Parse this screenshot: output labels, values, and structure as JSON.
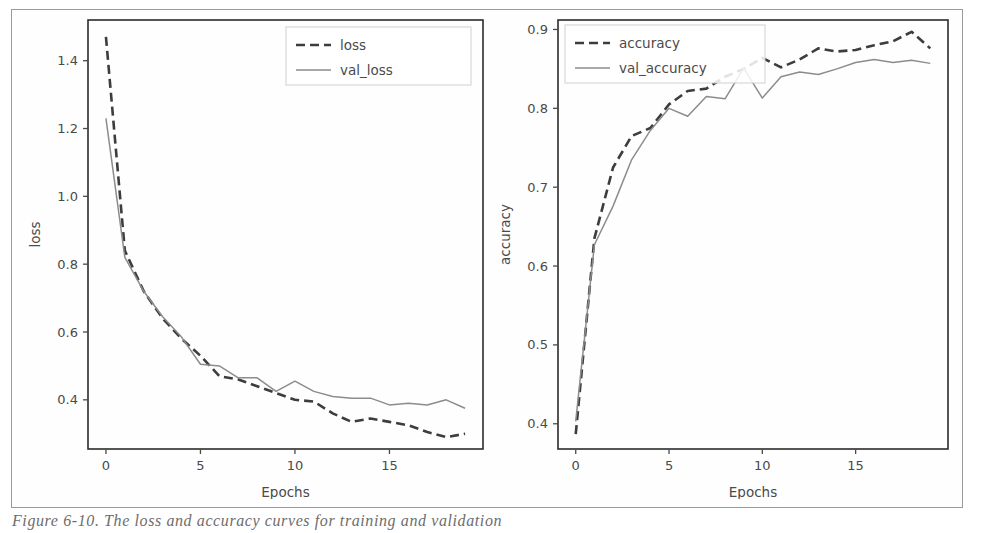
{
  "figure": {
    "caption": "Figure 6-10. The loss and accuracy curves for training and validation",
    "background_color": "#ffffff",
    "frame_color": "#9a9a9a"
  },
  "style": {
    "train_color": "#3d3d3d",
    "val_color": "#8c8c8c",
    "axis_color": "#4a4a4a",
    "spine_color": "#2b2b2b"
  },
  "panels": [
    {
      "name": "loss-panel",
      "xlabel": "Epochs",
      "ylabel": "loss",
      "xticks": [
        "0",
        "5",
        "10",
        "15"
      ],
      "yticks": [
        "0.4",
        "0.6",
        "0.8",
        "1.0",
        "1.2",
        "1.4"
      ],
      "legend": [
        {
          "label": "loss",
          "style": "dashed"
        },
        {
          "label": "val_loss",
          "style": "solid"
        }
      ]
    },
    {
      "name": "accuracy-panel",
      "xlabel": "Epochs",
      "ylabel": "accuracy",
      "xticks": [
        "0",
        "5",
        "10",
        "15"
      ],
      "yticks": [
        "0.4",
        "0.5",
        "0.6",
        "0.7",
        "0.8",
        "0.9"
      ],
      "legend": [
        {
          "label": "accuracy",
          "style": "dashed"
        },
        {
          "label": "val_accuracy",
          "style": "solid"
        }
      ]
    }
  ],
  "chart_data": [
    {
      "type": "line",
      "title": "",
      "xlabel": "Epochs",
      "ylabel": "loss",
      "xlim": [
        -0.95,
        19.95
      ],
      "ylim": [
        0.255,
        1.52
      ],
      "xticks": [
        0,
        5,
        10,
        15
      ],
      "yticks": [
        0.4,
        0.6,
        0.8,
        1.0,
        1.2,
        1.4
      ],
      "grid": false,
      "legend_position": "upper right",
      "x": [
        0,
        1,
        2,
        3,
        4,
        5,
        6,
        7,
        8,
        9,
        10,
        11,
        12,
        13,
        14,
        15,
        16,
        17,
        18,
        19
      ],
      "series": [
        {
          "name": "loss",
          "style": "dashed",
          "color": "#3d3d3d",
          "values": [
            1.47,
            0.84,
            0.72,
            0.64,
            0.58,
            0.53,
            0.47,
            0.46,
            0.44,
            0.42,
            0.4,
            0.395,
            0.36,
            0.335,
            0.345,
            0.335,
            0.325,
            0.305,
            0.29,
            0.3
          ]
        },
        {
          "name": "val_loss",
          "style": "solid",
          "color": "#8c8c8c",
          "values": [
            1.23,
            0.82,
            0.72,
            0.645,
            0.585,
            0.505,
            0.5,
            0.465,
            0.465,
            0.425,
            0.455,
            0.425,
            0.41,
            0.405,
            0.405,
            0.385,
            0.39,
            0.385,
            0.4,
            0.375
          ]
        }
      ]
    },
    {
      "type": "line",
      "title": "",
      "xlabel": "Epochs",
      "ylabel": "accuracy",
      "xlim": [
        -0.95,
        19.95
      ],
      "ylim": [
        0.368,
        0.912
      ],
      "xticks": [
        0,
        5,
        10,
        15
      ],
      "yticks": [
        0.4,
        0.5,
        0.6,
        0.7,
        0.8,
        0.9
      ],
      "grid": false,
      "legend_position": "upper left",
      "x": [
        0,
        1,
        2,
        3,
        4,
        5,
        6,
        7,
        8,
        9,
        10,
        11,
        12,
        13,
        14,
        15,
        16,
        17,
        18,
        19
      ],
      "series": [
        {
          "name": "accuracy",
          "style": "dashed",
          "color": "#3d3d3d",
          "values": [
            0.387,
            0.635,
            0.725,
            0.765,
            0.775,
            0.805,
            0.822,
            0.825,
            0.84,
            0.85,
            0.864,
            0.852,
            0.862,
            0.876,
            0.872,
            0.874,
            0.88,
            0.885,
            0.897,
            0.876
          ]
        },
        {
          "name": "val_accuracy",
          "style": "solid",
          "color": "#8c8c8c",
          "values": [
            0.403,
            0.627,
            0.676,
            0.735,
            0.772,
            0.8,
            0.79,
            0.815,
            0.812,
            0.851,
            0.813,
            0.84,
            0.846,
            0.843,
            0.85,
            0.858,
            0.862,
            0.858,
            0.861,
            0.857
          ]
        }
      ]
    }
  ]
}
